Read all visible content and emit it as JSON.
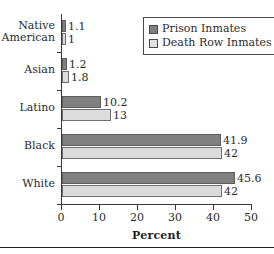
{
  "chart_data": {
    "type": "bar",
    "orientation": "horizontal",
    "title": "",
    "xlabel": "Percent",
    "ylabel": "",
    "xlim": [
      0,
      50
    ],
    "xticks": [
      "0",
      "10",
      "20",
      "30",
      "40",
      "50"
    ],
    "grid": false,
    "legend_position": "top-right",
    "categories": [
      "Native\nAmerican",
      "Asian",
      "Latino",
      "Black",
      "White"
    ],
    "series": [
      {
        "name": "Prison Inmates",
        "color": "#808080",
        "values": [
          1.1,
          1.2,
          10.2,
          41.9,
          45.6
        ],
        "labels": [
          "1.1",
          "1.2",
          "10.2",
          "41.9",
          "45.6"
        ]
      },
      {
        "name": "Death Row Inmates",
        "color": "#dcdcdc",
        "values": [
          1,
          1.8,
          13,
          42,
          42
        ],
        "labels": [
          "1",
          "1.8",
          "13",
          "42",
          "42"
        ]
      }
    ]
  }
}
